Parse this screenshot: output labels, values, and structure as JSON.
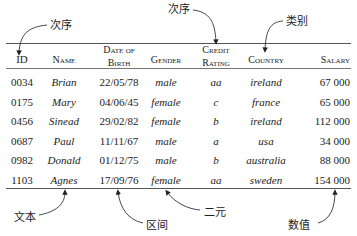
{
  "table": {
    "columns": [
      {
        "key": "id",
        "label_lines": [
          "ID"
        ],
        "style": "normal",
        "align": "center"
      },
      {
        "key": "name",
        "label_lines": [
          "Name"
        ],
        "style": "italic",
        "align": "center"
      },
      {
        "key": "dob",
        "label_lines": [
          "Date of",
          "Birth"
        ],
        "style": "normal",
        "align": "center"
      },
      {
        "key": "gender",
        "label_lines": [
          "Gender"
        ],
        "style": "italic",
        "align": "center"
      },
      {
        "key": "credit",
        "label_lines": [
          "Credit",
          "Rating"
        ],
        "style": "italic",
        "align": "center"
      },
      {
        "key": "country",
        "label_lines": [
          "Country"
        ],
        "style": "italic",
        "align": "center"
      },
      {
        "key": "salary",
        "label_lines": [
          "Salary"
        ],
        "style": "normal",
        "align": "right"
      }
    ],
    "rows": [
      [
        "0034",
        "Brian",
        "22/05/78",
        "male",
        "aa",
        "ireland",
        "67 000"
      ],
      [
        "0175",
        "Mary",
        "04/06/45",
        "female",
        "c",
        "france",
        "65 000"
      ],
      [
        "0456",
        "Sinead",
        "29/02/82",
        "female",
        "b",
        "ireland",
        "112 000"
      ],
      [
        "0687",
        "Paul",
        "11/11/67",
        "male",
        "a",
        "usa",
        "34 000"
      ],
      [
        "0982",
        "Donald",
        "01/12/75",
        "male",
        "b",
        "australia",
        "88 000"
      ],
      [
        "1103",
        "Agnes",
        "17/09/76",
        "female",
        "aa",
        "sweden",
        "154 000"
      ]
    ]
  },
  "annotations": {
    "id_ordinal": "次序",
    "credit_ordinal": "次序",
    "country_categorical": "类别",
    "name_textual": "文本",
    "dob_interval": "区间",
    "gender_binary": "二元",
    "salary_numeric": "数值"
  }
}
